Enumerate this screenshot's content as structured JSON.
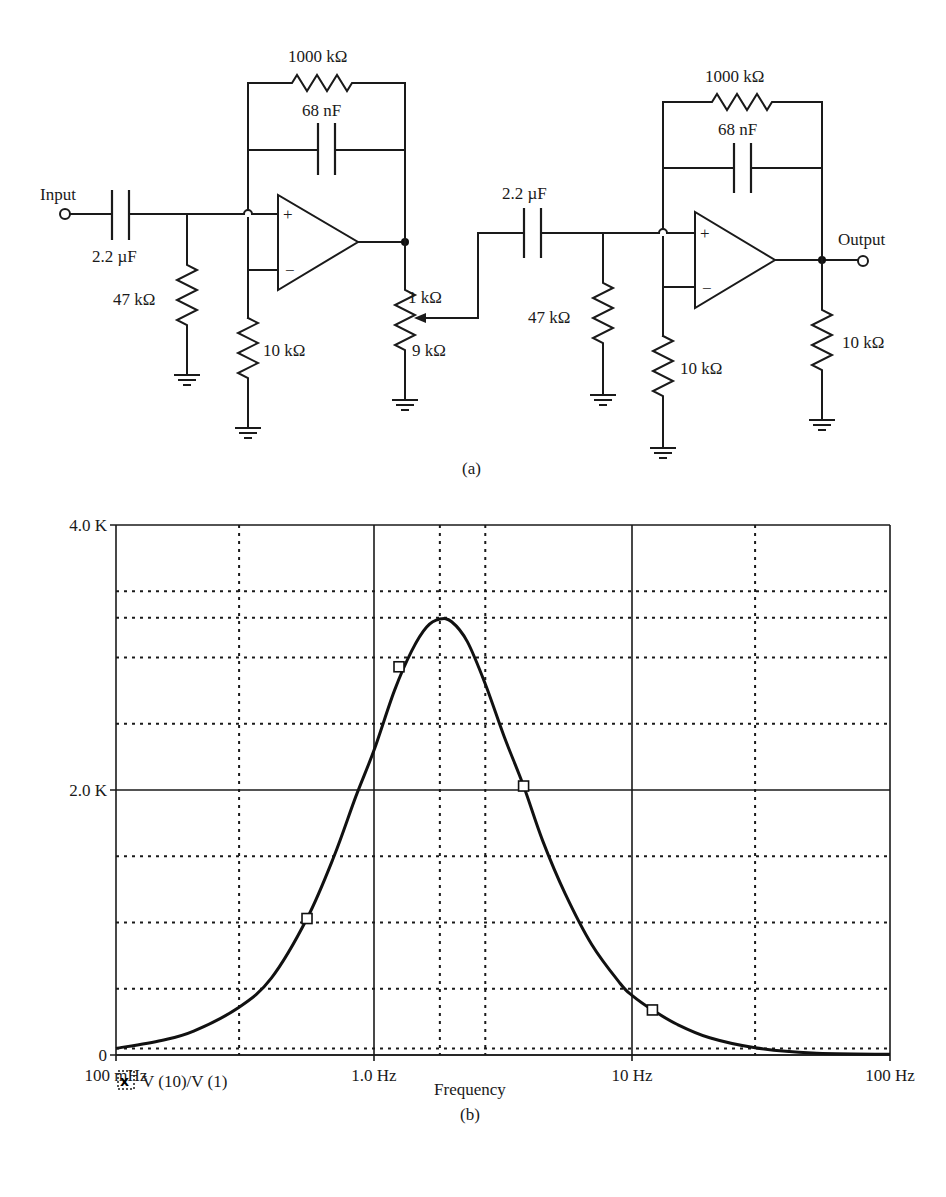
{
  "figure": {
    "part_a_label": "(a)",
    "part_b_label": "(b)"
  },
  "circuit": {
    "input_label": "Input",
    "output_label": "Output",
    "stage1": {
      "input_cap": "2.2 µF",
      "shunt_res": "47 kΩ",
      "feedback_res": "1000 kΩ",
      "feedback_cap": "68 nF",
      "ground_res": "10 kΩ",
      "pot_top": "1 kΩ",
      "pot_bottom": "9 kΩ"
    },
    "stage2": {
      "input_cap": "2.2 µF",
      "shunt_res": "47 kΩ",
      "feedback_res": "1000 kΩ",
      "feedback_cap": "68 nF",
      "ground_res": "10 kΩ",
      "load_res": "10 kΩ"
    },
    "opamp_plus": "+",
    "opamp_minus": "−"
  },
  "chart_data": {
    "type": "line",
    "title": "",
    "xlabel": "Frequency",
    "ylabel": "",
    "x_scale": "log",
    "xlim": [
      0.1,
      100
    ],
    "ylim": [
      0,
      4000
    ],
    "x_tick_labels": [
      "100 mHz",
      "1.0 Hz",
      "10 Hz",
      "100 Hz"
    ],
    "x_ticks": [
      0.1,
      1.0,
      10,
      100
    ],
    "y_tick_labels": [
      "0",
      "2.0 K",
      "4.0 K"
    ],
    "y_ticks": [
      0,
      2000,
      4000
    ],
    "grid": true,
    "grid_minor_y": [
      50,
      500,
      1000,
      1500,
      2500,
      3000,
      3300,
      3500
    ],
    "grid_minor_x": [
      0.3,
      1.8,
      2.7,
      30
    ],
    "legend": [
      {
        "symbol": "x",
        "label": "V (10)/V (1)"
      }
    ],
    "legend_position": "bottom-left",
    "series": [
      {
        "name": "V (10)/V (1)",
        "x": [
          0.1,
          0.15,
          0.2,
          0.3,
          0.4,
          0.55,
          0.7,
          0.85,
          1.0,
          1.2,
          1.4,
          1.6,
          1.8,
          2.0,
          2.3,
          2.7,
          3.2,
          3.8,
          4.5,
          5.5,
          7,
          9,
          10,
          12,
          15,
          20,
          30,
          50,
          100
        ],
        "values": [
          50,
          110,
          180,
          360,
          580,
          1030,
          1500,
          1950,
          2300,
          2750,
          3050,
          3230,
          3290,
          3270,
          3120,
          2800,
          2400,
          2030,
          1620,
          1220,
          830,
          540,
          450,
          340,
          230,
          130,
          55,
          15,
          5
        ]
      }
    ],
    "markers": [
      {
        "x": 0.55,
        "y": 1030
      },
      {
        "x": 1.25,
        "y": 2930
      },
      {
        "x": 3.8,
        "y": 2030
      },
      {
        "x": 12,
        "y": 340
      }
    ],
    "peak": {
      "x": 1.8,
      "y": 3290
    }
  }
}
